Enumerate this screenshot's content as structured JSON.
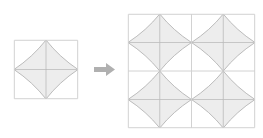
{
  "figure": {
    "type": "tessellation-diagram",
    "background_color": "#ffffff"
  },
  "colors": {
    "star_fill": "#ededed",
    "star_outline": "#b4b4b4",
    "tile_border": "#d2d2d2",
    "crosshair": "#d8d8d8",
    "arrow": "#b0b0b0"
  },
  "single_tile_panel": {
    "label": "single tile",
    "x": 14,
    "y": 40,
    "width": 64,
    "height": 59,
    "rows": 1,
    "columns": 1,
    "motif": {
      "name": "four-pointed-concave-star",
      "points": 4,
      "point_directions": [
        "up",
        "right",
        "down",
        "left"
      ],
      "has_center_crosshair": true,
      "has_center_diagonals": true,
      "concavity": 0.42
    }
  },
  "arrow": {
    "name": "transformation-arrow",
    "direction": "right",
    "x": 94,
    "y": 62,
    "width": 21,
    "height": 15
  },
  "tiled_panel": {
    "label": "2 by 2 tiling",
    "x": 128,
    "y": 14,
    "width": 127,
    "height": 114,
    "rows": 2,
    "columns": 2,
    "tile_count": 4,
    "motif": {
      "name": "four-pointed-concave-star",
      "points": 4,
      "point_directions": [
        "up",
        "right",
        "down",
        "left"
      ],
      "has_center_crosshair": true,
      "has_center_diagonals": true,
      "concavity": 0.42
    }
  }
}
